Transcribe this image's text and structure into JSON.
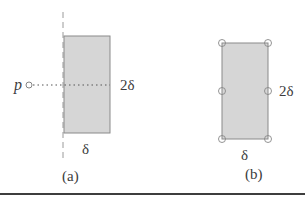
{
  "figure": {
    "panel_a": {
      "caption": "(a)",
      "point_label": "p",
      "height_label": "2δ",
      "width_label": "δ",
      "rect": {
        "x": 64,
        "y": 36,
        "w": 46,
        "h": 97
      },
      "point": {
        "cx": 29,
        "cy": 85,
        "r": 3
      },
      "dotted_line": {
        "x1": 33,
        "x2": 110,
        "y": 85
      },
      "dashed_line": {
        "x": 63,
        "y1": 12,
        "y2": 160
      }
    },
    "panel_b": {
      "caption": "(b)",
      "height_label": "2δ",
      "width_label": "δ",
      "rect": {
        "x": 222,
        "y": 43,
        "w": 46,
        "h": 96
      },
      "vertex_circles": [
        {
          "cx": 222,
          "cy": 43
        },
        {
          "cx": 268,
          "cy": 43
        },
        {
          "cx": 222,
          "cy": 91
        },
        {
          "cx": 268,
          "cy": 91
        },
        {
          "cx": 222,
          "cy": 139
        },
        {
          "cx": 268,
          "cy": 139
        }
      ]
    },
    "colors": {
      "rect_fill": "#d6d6d6",
      "rect_stroke": "#8a8a8a",
      "line": "#6a6a6a",
      "text": "#3c3c3c",
      "rule": "#3e3e3e"
    }
  }
}
